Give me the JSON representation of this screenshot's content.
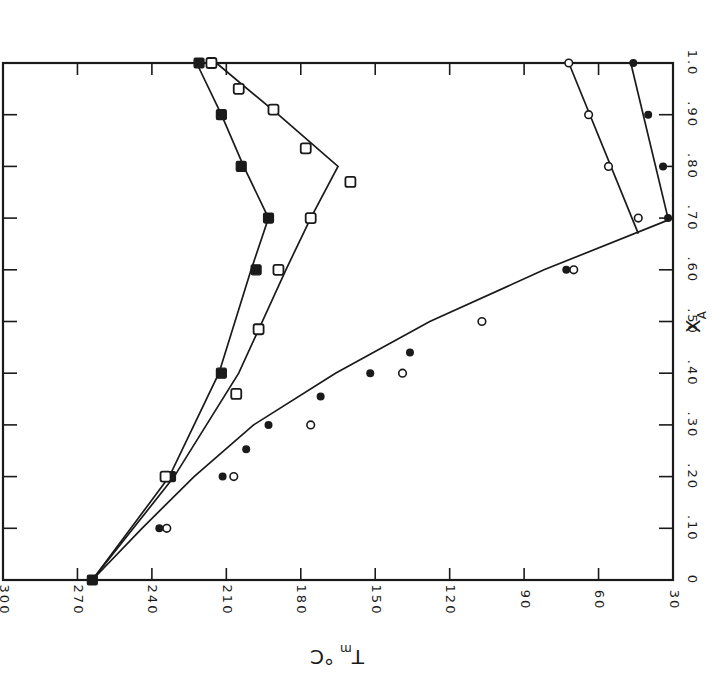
{
  "chart_data": {
    "type": "scatter",
    "orientation": "rotated 90 degrees clockwise (page rotated)",
    "title": "",
    "xlabel": "X_A",
    "ylabel": "T_m °C",
    "xlabel_main": "X",
    "xlabel_sub": "A",
    "ylabel_main": "T",
    "ylabel_sub": "m",
    "ylabel_unit": "°C",
    "xlim": [
      0,
      1.0
    ],
    "ylim": [
      30,
      300
    ],
    "x_ticks": [
      "0",
      ".10",
      ".20",
      ".30",
      ".40",
      ".50",
      ".60",
      ".70",
      ".80",
      ".90",
      "1.0"
    ],
    "x_tick_values": [
      0,
      0.1,
      0.2,
      0.3,
      0.4,
      0.5,
      0.6,
      0.7,
      0.8,
      0.9,
      1.0
    ],
    "y_ticks": [
      "30",
      "60",
      "90",
      "120",
      "150",
      "180",
      "210",
      "240",
      "270",
      "300"
    ],
    "y_tick_values": [
      30,
      60,
      90,
      120,
      150,
      180,
      210,
      240,
      270,
      300
    ],
    "grid": false,
    "legend": "none",
    "series": [
      {
        "name": "filled-circles",
        "marker": "filled-circle",
        "points": [
          [
            0.0,
            264
          ],
          [
            0.1,
            237
          ],
          [
            0.2,
            211.5
          ],
          [
            0.253,
            202
          ],
          [
            0.3,
            193
          ],
          [
            0.355,
            172
          ],
          [
            0.4,
            152
          ],
          [
            0.44,
            136
          ],
          [
            0.6,
            73
          ],
          [
            0.7,
            32
          ],
          [
            0.8,
            34
          ],
          [
            0.9,
            40
          ],
          [
            1.0,
            46
          ]
        ]
      },
      {
        "name": "open-circles",
        "marker": "open-circle",
        "points": [
          [
            0.1,
            234
          ],
          [
            0.2,
            207
          ],
          [
            0.3,
            176
          ],
          [
            0.4,
            139
          ],
          [
            0.5,
            107
          ],
          [
            0.6,
            70
          ],
          [
            0.7,
            44
          ],
          [
            0.8,
            56
          ],
          [
            0.9,
            64
          ],
          [
            1.0,
            72
          ]
        ]
      },
      {
        "name": "filled-squares",
        "marker": "filled-square",
        "points": [
          [
            0.0,
            264
          ],
          [
            0.2,
            232.5
          ],
          [
            0.4,
            212
          ],
          [
            0.6,
            198
          ],
          [
            0.7,
            193
          ],
          [
            0.8,
            204
          ],
          [
            0.9,
            212
          ],
          [
            1.0,
            221
          ]
        ]
      },
      {
        "name": "open-squares",
        "marker": "open-square",
        "points": [
          [
            0.2,
            234.5
          ],
          [
            0.36,
            206
          ],
          [
            0.485,
            197
          ],
          [
            0.6,
            189
          ],
          [
            0.7,
            176
          ],
          [
            0.77,
            160
          ],
          [
            0.835,
            178
          ],
          [
            0.91,
            191
          ],
          [
            0.95,
            205
          ],
          [
            1.0,
            216
          ]
        ]
      }
    ],
    "curves": [
      {
        "name": "circle-liquidus-left",
        "points": [
          [
            0.0,
            264
          ],
          [
            0.1,
            244
          ],
          [
            0.2,
            223
          ],
          [
            0.3,
            199
          ],
          [
            0.4,
            166
          ],
          [
            0.5,
            128
          ],
          [
            0.6,
            82
          ],
          [
            0.7,
            30
          ]
        ]
      },
      {
        "name": "circle-liquidus-right-open",
        "points": [
          [
            0.67,
            44
          ],
          [
            1.0,
            72
          ]
        ]
      },
      {
        "name": "circle-liquidus-right-filled",
        "points": [
          [
            0.7,
            32
          ],
          [
            1.0,
            47
          ]
        ]
      },
      {
        "name": "filled-square-curve",
        "points": [
          [
            0.0,
            264
          ],
          [
            0.2,
            233
          ],
          [
            0.4,
            213
          ],
          [
            0.6,
            200
          ],
          [
            0.7,
            193
          ],
          [
            0.8,
            203
          ],
          [
            0.9,
            212
          ],
          [
            1.0,
            222
          ]
        ]
      },
      {
        "name": "open-square-curve",
        "points": [
          [
            0.0,
            264
          ],
          [
            0.2,
            231
          ],
          [
            0.4,
            205
          ],
          [
            0.6,
            186
          ],
          [
            0.7,
            176
          ],
          [
            0.8,
            165
          ],
          [
            0.9,
            189
          ],
          [
            1.0,
            214
          ]
        ]
      }
    ]
  }
}
